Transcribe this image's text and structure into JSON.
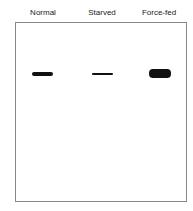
{
  "lanes": [
    {
      "label": "Normal"
    },
    {
      "label": "Starved"
    },
    {
      "label": "Force-fed"
    }
  ]
}
